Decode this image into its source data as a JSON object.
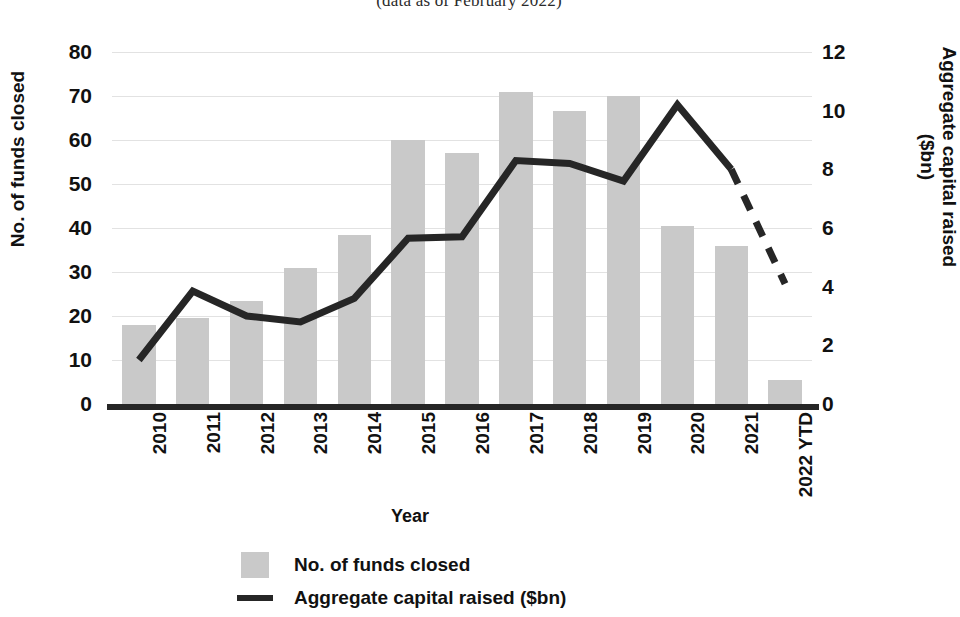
{
  "title": {
    "subtitle": "(data as of February 2022)"
  },
  "axes": {
    "left": {
      "label": "No. of funds closed",
      "ticks": [
        "80",
        "70",
        "60",
        "50",
        "40",
        "30",
        "20",
        "10",
        "0"
      ],
      "min": 0,
      "max": 80
    },
    "right": {
      "label_line1": "Aggregate capital raised",
      "label_line2": "($bn)",
      "ticks": [
        "12",
        "10",
        "8",
        "6",
        "4",
        "2",
        "0"
      ],
      "min": 0,
      "max": 12
    },
    "x": {
      "label": "Year"
    }
  },
  "legend": {
    "items": [
      {
        "label": "No. of funds closed",
        "marker": "box",
        "color": "#c9c9c9"
      },
      {
        "label": "Aggregate capital raised ($bn)",
        "marker": "line",
        "color": "#262626"
      }
    ]
  },
  "colors": {
    "bar": "#c9c9c9",
    "line": "#262626",
    "grid": "#e2e2e2",
    "text": "#111111"
  },
  "chart_data": {
    "type": "bar",
    "title": "(data as of February 2022)",
    "xlabel": "Year",
    "ylabel": "No. of funds closed",
    "ylabel_secondary": "Aggregate capital raised ($bn)",
    "ylim": [
      0,
      80
    ],
    "ylim_secondary": [
      0,
      12
    ],
    "grid": true,
    "legend_position": "bottom",
    "categories": [
      "2010",
      "2011",
      "2012",
      "2013",
      "2014",
      "2015",
      "2016",
      "2017",
      "2018",
      "2019",
      "2020",
      "2021",
      "2022 YTD"
    ],
    "series": [
      {
        "name": "No. of funds closed",
        "type": "bar",
        "axis": "left",
        "color": "#c9c9c9",
        "values": [
          18,
          19.5,
          23.5,
          31,
          38.5,
          60,
          57,
          71,
          66.5,
          70,
          40.5,
          36,
          5.5
        ]
      },
      {
        "name": "Aggregate capital raised ($bn)",
        "type": "line",
        "axis": "right",
        "color": "#262626",
        "values": [
          1.5,
          3.85,
          3.0,
          2.8,
          3.6,
          5.65,
          5.7,
          8.3,
          8.2,
          7.6,
          10.2,
          8.0,
          4.1
        ],
        "dashed_from_index": 11
      }
    ]
  }
}
